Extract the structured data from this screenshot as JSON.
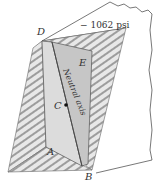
{
  "diagram": {
    "labels": {
      "D": "D",
      "E": "E",
      "C": "C",
      "A": "A",
      "B": "B",
      "neutral_axis": "Neutral axis",
      "stress": "− 1062 psi"
    },
    "colors": {
      "outline": "#555555",
      "section_light": "#dcdcdc",
      "section_dark": "#c4c4c4",
      "hatch_bg": "#e6e6e6",
      "hatch_line": "#888888",
      "arrow": "#666666"
    }
  }
}
